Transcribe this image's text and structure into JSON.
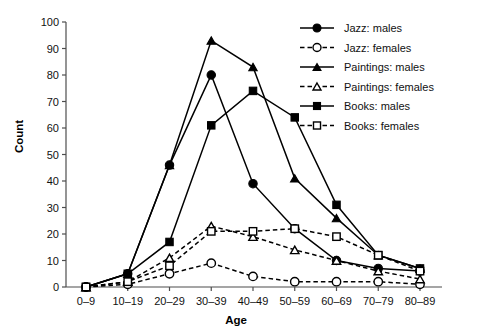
{
  "chart_data": {
    "type": "line",
    "title": "",
    "xlabel": "Age",
    "ylabel": "Count",
    "categories": [
      "0–9",
      "10–19",
      "20–29",
      "30–39",
      "40–49",
      "50–59",
      "60–69",
      "70–79",
      "80–89"
    ],
    "ylim": [
      0,
      100
    ],
    "yticks": [
      0,
      10,
      20,
      30,
      40,
      50,
      60,
      70,
      80,
      90,
      100
    ],
    "grid": false,
    "legend_position": "top-right",
    "series": [
      {
        "name": "Jazz: males",
        "marker": "filled-circle",
        "line": "solid",
        "values": [
          0,
          5,
          46,
          80,
          39,
          22,
          10,
          7,
          6
        ]
      },
      {
        "name": "Jazz: females",
        "marker": "open-circle",
        "line": "dashed",
        "values": [
          0,
          1,
          5,
          9,
          4,
          2,
          2,
          2,
          1
        ]
      },
      {
        "name": "Paintings: males",
        "marker": "filled-triangle",
        "line": "solid",
        "values": [
          0,
          5,
          46,
          93,
          83,
          41,
          26,
          12,
          7
        ]
      },
      {
        "name": "Paintings: females",
        "marker": "open-triangle",
        "line": "dashed",
        "values": [
          0,
          2,
          11,
          23,
          19,
          14,
          10,
          6,
          3
        ]
      },
      {
        "name": "Books: males",
        "marker": "filled-square",
        "line": "solid",
        "values": [
          0,
          5,
          17,
          61,
          74,
          64,
          31,
          12,
          7
        ]
      },
      {
        "name": "Books: females",
        "marker": "open-square",
        "line": "dashed",
        "values": [
          0,
          2,
          8,
          21,
          21,
          22,
          19,
          12,
          6
        ]
      }
    ]
  }
}
